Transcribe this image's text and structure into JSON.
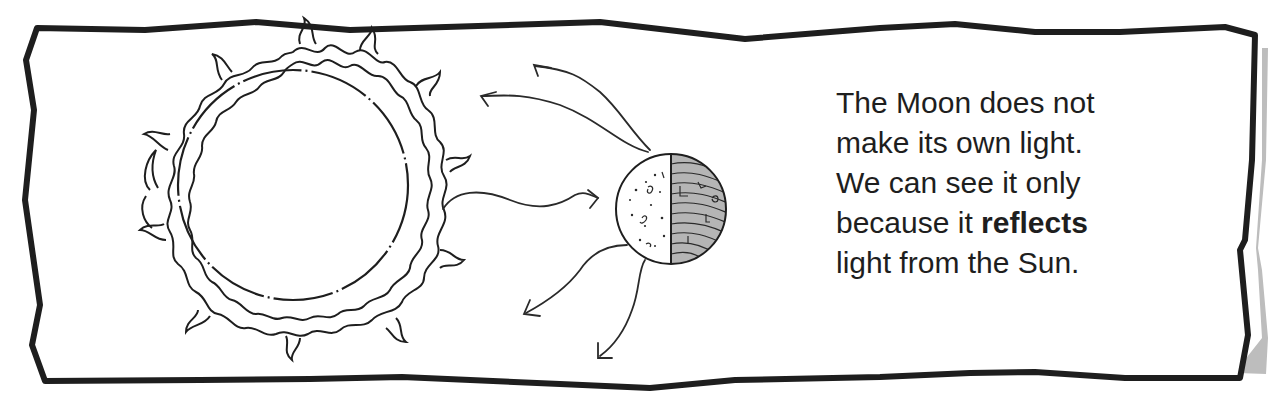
{
  "figure": {
    "elements": {
      "sun": {
        "label": "sun-icon"
      },
      "moon": {
        "label": "moon-icon",
        "lit_side": "left",
        "dark_side": "right"
      },
      "incoming_ray": {
        "label": "arrow-right-icon",
        "direction": "sun-to-moon"
      },
      "reflected_rays": {
        "count": 4,
        "label": "arrow-icon"
      }
    },
    "colors": {
      "frame_stroke": "#1e1e1e",
      "frame_shadow": "#bdbdbd",
      "moon_dark_fill": "#b5b5b5",
      "text": "#1e1e1e"
    }
  },
  "caption": {
    "line1": "The Moon does not",
    "line2": "make its own light.",
    "line3": "We can see it only",
    "line4_pre": "because it ",
    "line4_bold": "reflects",
    "line5": "light from the Sun."
  }
}
